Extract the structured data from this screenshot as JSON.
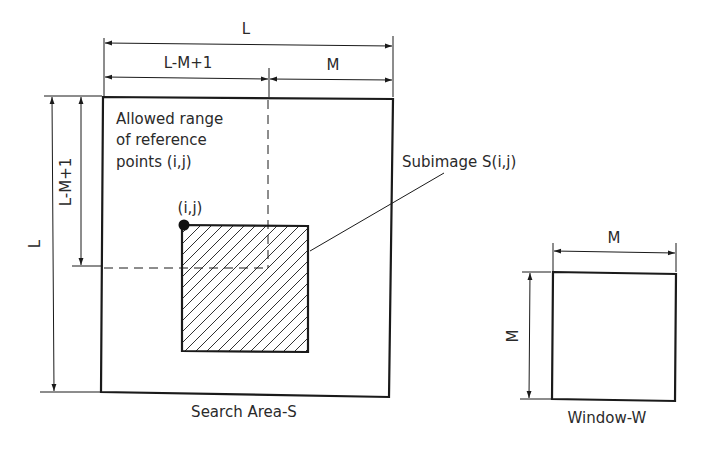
{
  "diagram": {
    "search_area": {
      "caption": "Search Area-S",
      "top_dimension_label": "L",
      "left_dimension_label": "L"
    },
    "reference_range": {
      "label_lines": [
        "Allowed range",
        "of reference",
        "points (i,j)"
      ],
      "top_dimension_label": "L-M+1",
      "left_dimension_label": "L-M+1"
    },
    "subimage": {
      "label": "Subimage S(i,j)",
      "reference_point_label": "(i,j)",
      "top_dimension_label": "M"
    },
    "window": {
      "caption": "Window-W",
      "top_dimension_label": "M",
      "left_dimension_label": "M"
    },
    "colors": {
      "ink": "#1a1a1a",
      "background": "#ffffff"
    }
  }
}
